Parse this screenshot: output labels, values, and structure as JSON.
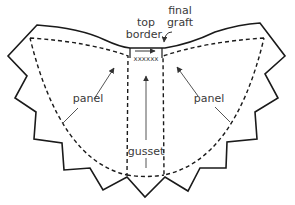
{
  "diagram": {
    "labels": {
      "top_border_line1": "top",
      "top_border_line2": "border",
      "final_graft_line1": "final",
      "final_graft_line2": "graft",
      "stitches": "xxxxxx",
      "panel_left": "panel",
      "panel_right": "panel",
      "gusset": "gusset"
    },
    "colors": {
      "outline": "#1a1a1a",
      "arrow": "#555555",
      "text": "#3a3a3a"
    }
  }
}
